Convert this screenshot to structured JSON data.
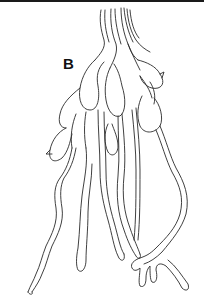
{
  "figure": {
    "panel_label": "B",
    "colors": {
      "background": "#ffffff",
      "line": "#2a2a2a",
      "top_band": "#1a1a1a"
    }
  }
}
